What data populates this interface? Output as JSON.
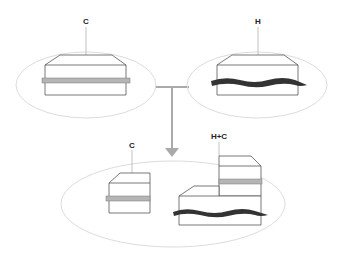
{
  "diagram": {
    "labels": {
      "top_left": "C",
      "top_right": "H",
      "bottom_left": "C",
      "bottom_right": "H+C"
    },
    "colors": {
      "ellipse": "#d8d8d8",
      "outline": "#555555",
      "connector": "#aaaaaa",
      "gray_band": "#b5b5b5",
      "dark_band": "#333333"
    }
  }
}
